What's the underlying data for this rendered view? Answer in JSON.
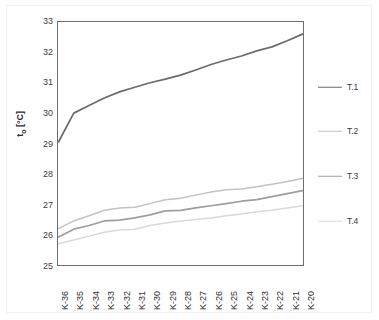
{
  "chart_data": {
    "type": "line",
    "title": "",
    "xlabel": "",
    "ylabel": "tₒ [°C]",
    "ylabel_base": "t",
    "ylabel_sub": "o",
    "ylabel_unit": " [°C]",
    "ylim": [
      25,
      33
    ],
    "yticks": [
      25,
      26,
      27,
      28,
      29,
      30,
      31,
      32,
      33
    ],
    "ytick_labels": [
      "25",
      "26",
      "27",
      "28",
      "29",
      "30",
      "31",
      "32",
      "33"
    ],
    "grid": false,
    "legend_position": "right",
    "categories": [
      "K-36",
      "K-35",
      "K-34",
      "K-33",
      "K-32",
      "K-31",
      "K-30",
      "K-29",
      "K-28",
      "K-27",
      "K-26",
      "K-25",
      "K-24",
      "K-23",
      "K-22",
      "K-21",
      "K-20"
    ],
    "series": [
      {
        "name": "T.1",
        "color": "#6b6b6b",
        "values": [
          29.05,
          30.0,
          30.25,
          30.5,
          30.7,
          30.85,
          31.0,
          31.12,
          31.25,
          31.42,
          31.6,
          31.75,
          31.88,
          32.05,
          32.18,
          32.38,
          32.6
        ]
      },
      {
        "name": "T.2",
        "color": "#c2c2c2",
        "values": [
          26.2,
          26.45,
          26.62,
          26.8,
          26.88,
          26.9,
          27.02,
          27.15,
          27.2,
          27.3,
          27.4,
          27.48,
          27.5,
          27.58,
          27.66,
          27.75,
          27.85
        ]
      },
      {
        "name": "T.3",
        "color": "#9e9e9e",
        "values": [
          25.92,
          26.18,
          26.3,
          26.45,
          26.48,
          26.55,
          26.65,
          26.78,
          26.8,
          26.88,
          26.95,
          27.02,
          27.1,
          27.15,
          27.25,
          27.35,
          27.45
        ]
      },
      {
        "name": "T.4",
        "color": "#d9d9d9",
        "values": [
          25.7,
          25.82,
          25.95,
          26.08,
          26.15,
          26.18,
          26.3,
          26.38,
          26.45,
          26.5,
          26.55,
          26.62,
          26.68,
          26.75,
          26.8,
          26.88,
          26.95
        ]
      }
    ]
  },
  "legend": {
    "items": [
      {
        "label": "T.1",
        "color": "#6b6b6b",
        "thickness": 1.6
      },
      {
        "label": "T.2",
        "color": "#c2c2c2",
        "thickness": 1.4
      },
      {
        "label": "T.3",
        "color": "#9e9e9e",
        "thickness": 1.6
      },
      {
        "label": "T.4",
        "color": "#d9d9d9",
        "thickness": 1.4
      }
    ]
  }
}
